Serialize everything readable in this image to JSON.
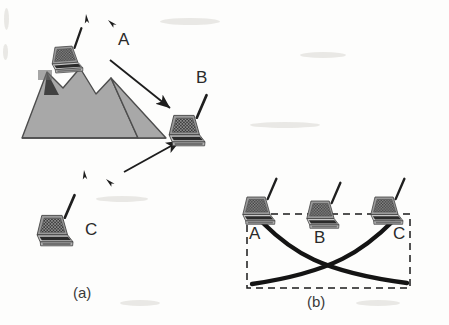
{
  "figure": {
    "background_color": "#fdfdfc",
    "ink_color": "#2a2a2a",
    "mountain_fill": "#a8a8a8",
    "mountain_stroke": "#4a4a4a",
    "curve_color": "#1a1a1a",
    "dashed_color": "#1a1a1a"
  },
  "panel_a": {
    "caption": "(a)",
    "nodes": [
      {
        "id": "node-a",
        "label": "A",
        "x": 118,
        "y": 38,
        "laptop_x": 47,
        "laptop_y": 28,
        "scale": 0.62,
        "rotation": -4
      },
      {
        "id": "node-b",
        "label": "B",
        "x": 196,
        "y": 76,
        "laptop_x": 166,
        "laptop_y": 92,
        "scale": 0.72,
        "rotation": 0
      },
      {
        "id": "node-c",
        "label": "C",
        "x": 85,
        "y": 228,
        "laptop_x": 34,
        "laptop_y": 192,
        "scale": 0.72,
        "rotation": 0
      }
    ],
    "obstacle": {
      "name": "mountain",
      "description": "gray multi-peak mountain blocking line of sight between A and B"
    },
    "arrows": [
      {
        "name": "arrow-a-to-b",
        "from_x": 110,
        "from_y": 60,
        "to_x": 172,
        "to_y": 110
      },
      {
        "name": "arrow-c-to-b",
        "from_x": 124,
        "from_y": 172,
        "to_x": 182,
        "to_y": 139
      }
    ],
    "signal_marks": [
      {
        "name": "signal-mark-a-1",
        "x": 86,
        "y": 14
      },
      {
        "name": "signal-mark-a-2",
        "x": 106,
        "y": 22
      },
      {
        "name": "signal-mark-c-1",
        "x": 84,
        "y": 170
      },
      {
        "name": "signal-mark-c-2",
        "x": 104,
        "y": 181
      }
    ]
  },
  "panel_b": {
    "caption": "(b)",
    "nodes": [
      {
        "id": "node-b-a",
        "label": "A",
        "x": 252,
        "y": 233,
        "laptop_x": 240,
        "laptop_y": 176,
        "scale": 0.66
      },
      {
        "id": "node-b-b",
        "label": "B",
        "x": 319,
        "y": 236,
        "laptop_x": 304,
        "laptop_y": 180,
        "scale": 0.66
      },
      {
        "id": "node-b-c",
        "label": "C",
        "x": 396,
        "y": 233,
        "laptop_x": 368,
        "laptop_y": 176,
        "scale": 0.66
      }
    ],
    "plot_box": {
      "x": 247,
      "y": 214,
      "width": 163,
      "height": 74,
      "style": "dashed"
    },
    "curves": [
      {
        "name": "curve-a-decay",
        "start_x": 263,
        "start_y": 223,
        "end_x": 407,
        "end_y": 283,
        "description": "signal from A decaying left to right"
      },
      {
        "name": "curve-c-decay",
        "start_x": 393,
        "start_y": 221,
        "end_x": 252,
        "end_y": 284,
        "description": "signal from C decaying right to left"
      }
    ],
    "crossing_point": {
      "x": 330,
      "y": 264
    }
  },
  "laptop_art": {
    "name": "notebook-computer-with-antenna",
    "body_color": "#b8b8b8",
    "screen_color": "#6a6a6a",
    "keyboard_color": "#2e2e2e",
    "antenna_color": "#1f1f1f"
  }
}
